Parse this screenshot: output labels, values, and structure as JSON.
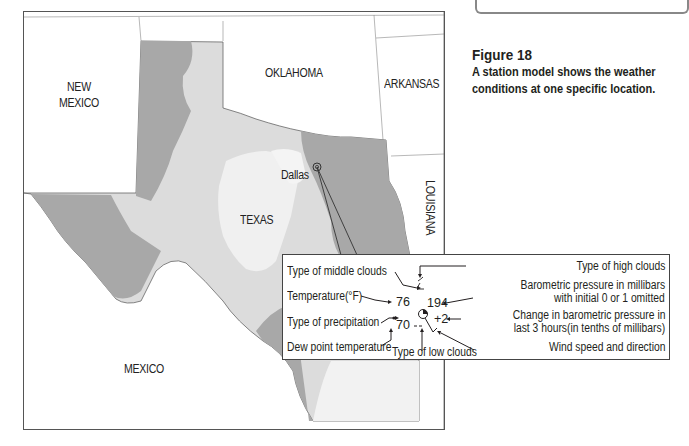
{
  "caption": {
    "figure": "Figure 18",
    "text": "A station model shows the weather conditions at one specific location."
  },
  "map": {
    "labels": {
      "new_mexico_1": "NEW",
      "new_mexico_2": "MEXICO",
      "oklahoma": "OKLAHOMA",
      "arkansas": "ARKANSAS",
      "louisiana": "LOUISIANA",
      "texas": "TEXAS",
      "mexico": "MEXICO",
      "dallas": "Dallas"
    },
    "colors": {
      "dark_zone": "#a9a9a9",
      "light_zone": "#d9d9d9",
      "lightest_zone": "#f0f0f0",
      "outside": "#ffffff"
    }
  },
  "station_model": {
    "values": {
      "temperature": "76",
      "dew_point": "70",
      "pressure": "194",
      "pressure_change": "+2"
    },
    "labels": {
      "middle_clouds": "Type of middle clouds",
      "high_clouds": "Type of high clouds",
      "temperature": "Temperature(°F)",
      "pressure_1": "Barometric pressure in millibars",
      "pressure_2": "with initial 0 or 1 omitted",
      "precipitation": "Type of precipitation",
      "change_1": "Change in barometric pressure in",
      "change_2": "last 3 hours(in tenths of millibars)",
      "dew_point": "Dew point temperature",
      "wind": "Wind speed and direction",
      "low_clouds": "Type of low clouds"
    }
  }
}
